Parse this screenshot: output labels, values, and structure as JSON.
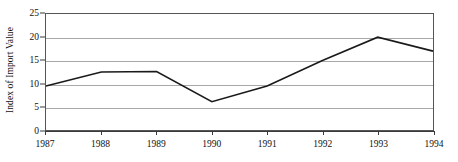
{
  "chart_data": {
    "type": "line",
    "title": "",
    "xlabel": "",
    "ylabel": "Index of Import Value",
    "categories": [
      "1987",
      "1988",
      "1989",
      "1990",
      "1991",
      "1992",
      "1993",
      "1994"
    ],
    "values": [
      9.5,
      12.5,
      12.6,
      6.1,
      9.5,
      15.0,
      20.0,
      17.0
    ],
    "series": [
      {
        "name": "Index of Import Value",
        "values": [
          9.5,
          12.5,
          12.6,
          6.1,
          9.5,
          15.0,
          20.0,
          17.0
        ]
      }
    ],
    "xlim": [
      1987,
      1994
    ],
    "ylim": [
      0,
      25
    ],
    "y_ticks": [
      0,
      5,
      10,
      15,
      20,
      25
    ],
    "x_ticks": [
      "1987",
      "1988",
      "1989",
      "1990",
      "1991",
      "1992",
      "1993",
      "1994"
    ],
    "grid": true,
    "grid_axis": "y",
    "legend": false,
    "legend_position": "none",
    "line_color": "#1a1a1a",
    "grid_color": "#a8a8a8",
    "axis_color": "#555555",
    "background_color": "#ffffff",
    "markers": false
  }
}
